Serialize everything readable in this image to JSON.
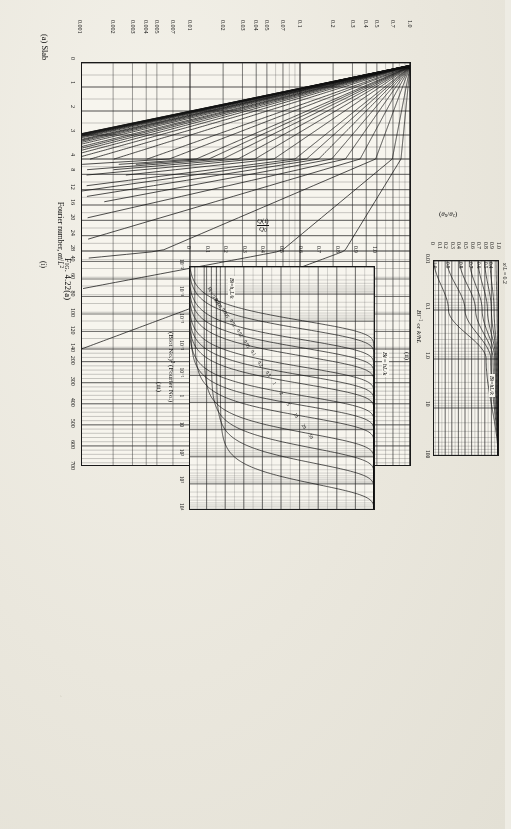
{
  "figure": {
    "caption_prefix": "Fig.",
    "caption_number": "4.22(a)",
    "part_label": "(a) Slab"
  },
  "panels": {
    "i": {
      "id": "(i)",
      "xlabel": "Fourier number, αt/L²",
      "ylabel": "(θ_c − θ_∞)/(θ_{i,o} − θ_∞)",
      "ylabel_parts": {
        "num_a": "θ",
        "num_a_sub": "c",
        "num_b": "θ",
        "num_b_sub": "∞",
        "den_a": "θ",
        "den_a_sub": "i,o",
        "den_b": "θ",
        "den_b_sub": "∞"
      },
      "legend": "Bi = hL/k",
      "xticks": [
        "0",
        "1",
        "2",
        "3",
        "4",
        "8",
        "12",
        "16",
        "20",
        "24",
        "28",
        "40",
        "60",
        "80",
        "100",
        "120",
        "140",
        "200",
        "300",
        "400",
        "500",
        "600",
        "700"
      ],
      "yticks": [
        "1.0",
        "0.7",
        "0.5",
        "0.4",
        "0.3",
        "0.2",
        "0.1",
        "0.07",
        "0.05",
        "0.04",
        "0.03",
        "0.02",
        "0.01",
        "0.007",
        "0.005",
        "0.004",
        "0.003",
        "0.002",
        "0.001"
      ],
      "curve_labels": [
        "0",
        "0.05",
        "0.1",
        "0.2",
        "0.3",
        "0.4",
        "0.5",
        "0.6",
        "0.7",
        "0.8",
        "1.0",
        "1.2",
        "1.4",
        "1.6",
        "1.8",
        "2",
        "2.5",
        "3",
        "4",
        "5",
        "6",
        "7",
        "8",
        "9",
        "10",
        "12",
        "14",
        "16",
        "18",
        "20",
        "25",
        "30",
        "35",
        "40",
        "45",
        "50",
        "60",
        "70",
        "80",
        "90",
        "100"
      ]
    },
    "ii": {
      "id": "(ii)",
      "xlabel": "Bi⁻¹ or k/hL",
      "ylabel": "(θ_x/θ_c)",
      "legend": "Bi = hL/k",
      "xticks": [
        "0.01",
        "0.1",
        "1.0",
        "10",
        "100"
      ],
      "yticks": [
        "0",
        "0.1",
        "0.2",
        "0.3",
        "0.4",
        "0.5",
        "0.6",
        "0.7",
        "0.8",
        "0.9",
        "1.0"
      ],
      "curve_label_lead": "x/L = 0.2",
      "curve_labels": [
        "0.2",
        "0.4",
        "0.5",
        "0.6",
        "0.7",
        "0.8",
        "0.9",
        "1.0"
      ]
    },
    "iii": {
      "id": "(iii)",
      "xlabel": "(Biot No.)² (Fourier No.)",
      "ylabel": "Q(t)/Q₀",
      "legend": "Bi = h_c L/k",
      "xticks": [
        "10⁻⁵",
        "10⁻⁴",
        "10⁻³",
        "10⁻²",
        "10⁻¹",
        "1",
        "10",
        "10²",
        "10³",
        "10⁴"
      ],
      "yticks": [
        "0",
        "0.1",
        "0.2",
        "0.3",
        "0.4",
        "0.5",
        "0.6",
        "0.7",
        "0.8",
        "0.9",
        "1.0"
      ],
      "curve_labels": [
        "Bi = 0.001",
        "0.002",
        "0.005",
        "0.01",
        "0.02",
        "0.05",
        "0.1",
        "0.2",
        "0.5",
        "1",
        "2",
        "5",
        "10",
        "20",
        "50"
      ]
    }
  },
  "chart_data": [
    {
      "type": "line",
      "title": "(i) Midplane temperature, slab",
      "xlabel": "Fourier number, αt/L²",
      "ylabel": "(θc−θ∞)/(θi,o−θ∞)",
      "xscale": "piecewise-linear",
      "yscale": "log",
      "xlim": [
        0,
        700
      ],
      "ylim": [
        0.001,
        1.0
      ],
      "grid": true,
      "legend": "Bi = hL/k",
      "legend_position": "upper-right-inside",
      "xticks": [
        0,
        1,
        2,
        3,
        4,
        8,
        12,
        16,
        20,
        24,
        28,
        40,
        60,
        80,
        100,
        120,
        140,
        200,
        300,
        400,
        500,
        600,
        700
      ],
      "yticks": [
        1.0,
        0.7,
        0.5,
        0.4,
        0.3,
        0.2,
        0.1,
        0.07,
        0.05,
        0.04,
        0.03,
        0.02,
        0.01,
        0.007,
        0.005,
        0.004,
        0.003,
        0.002,
        0.001
      ],
      "series": [
        {
          "name": "0",
          "note": "Bi=0, horizontal at 1.0"
        },
        {
          "name": "0.05"
        },
        {
          "name": "0.1"
        },
        {
          "name": "0.2"
        },
        {
          "name": "0.3"
        },
        {
          "name": "0.4"
        },
        {
          "name": "0.5"
        },
        {
          "name": "0.6"
        },
        {
          "name": "0.7"
        },
        {
          "name": "0.8"
        },
        {
          "name": "1.0"
        },
        {
          "name": "1.2"
        },
        {
          "name": "1.4"
        },
        {
          "name": "1.6"
        },
        {
          "name": "1.8"
        },
        {
          "name": "2"
        },
        {
          "name": "2.5"
        },
        {
          "name": "3"
        },
        {
          "name": "4"
        },
        {
          "name": "5"
        },
        {
          "name": "6"
        },
        {
          "name": "7"
        },
        {
          "name": "8"
        },
        {
          "name": "9"
        },
        {
          "name": "10"
        },
        {
          "name": "12"
        },
        {
          "name": "14"
        },
        {
          "name": "16"
        },
        {
          "name": "18"
        },
        {
          "name": "20"
        },
        {
          "name": "25"
        },
        {
          "name": "30"
        },
        {
          "name": "35"
        },
        {
          "name": "40"
        },
        {
          "name": "45"
        },
        {
          "name": "50"
        },
        {
          "name": "60"
        },
        {
          "name": "70"
        },
        {
          "name": "80"
        },
        {
          "name": "90"
        },
        {
          "name": "100"
        }
      ]
    },
    {
      "type": "line",
      "title": "(ii) Position-correction chart, slab",
      "xlabel": "Bi⁻¹ or k/hL",
      "ylabel": "(θx/θc)",
      "xscale": "log",
      "yscale": "linear",
      "xlim": [
        0.01,
        100
      ],
      "ylim": [
        0,
        1.0
      ],
      "grid": true,
      "legend": "Bi = hL/k",
      "xticks": [
        0.01,
        0.1,
        1.0,
        10,
        100
      ],
      "yticks": [
        0,
        0.1,
        0.2,
        0.3,
        0.4,
        0.5,
        0.6,
        0.7,
        0.8,
        0.9,
        1.0
      ],
      "series": [
        {
          "name": "x/L = 0.2",
          "values_at_x": [
            {
              "x": 0.01,
              "y": 0.97
            },
            {
              "x": 0.1,
              "y": 0.985
            },
            {
              "x": 1,
              "y": 0.995
            },
            {
              "x": 100,
              "y": 1.0
            }
          ]
        },
        {
          "name": "0.4",
          "values_at_x": [
            {
              "x": 0.01,
              "y": 0.88
            },
            {
              "x": 0.1,
              "y": 0.94
            },
            {
              "x": 1,
              "y": 0.985
            },
            {
              "x": 100,
              "y": 1.0
            }
          ]
        },
        {
          "name": "0.5",
          "values_at_x": [
            {
              "x": 0.01,
              "y": 0.8
            },
            {
              "x": 0.1,
              "y": 0.9
            },
            {
              "x": 1,
              "y": 0.975
            },
            {
              "x": 100,
              "y": 1.0
            }
          ]
        },
        {
          "name": "0.6",
          "values_at_x": [
            {
              "x": 0.01,
              "y": 0.7
            },
            {
              "x": 0.1,
              "y": 0.84
            },
            {
              "x": 1,
              "y": 0.965
            },
            {
              "x": 100,
              "y": 1.0
            }
          ]
        },
        {
          "name": "0.7",
          "values_at_x": [
            {
              "x": 0.01,
              "y": 0.57
            },
            {
              "x": 0.1,
              "y": 0.76
            },
            {
              "x": 1,
              "y": 0.95
            },
            {
              "x": 100,
              "y": 1.0
            }
          ]
        },
        {
          "name": "0.8",
          "values_at_x": [
            {
              "x": 0.01,
              "y": 0.42
            },
            {
              "x": 0.1,
              "y": 0.66
            },
            {
              "x": 1,
              "y": 0.925
            },
            {
              "x": 100,
              "y": 1.0
            }
          ]
        },
        {
          "name": "0.9",
          "values_at_x": [
            {
              "x": 0.01,
              "y": 0.23
            },
            {
              "x": 0.1,
              "y": 0.5
            },
            {
              "x": 1,
              "y": 0.89
            },
            {
              "x": 100,
              "y": 1.0
            }
          ]
        },
        {
          "name": "1.0",
          "values_at_x": [
            {
              "x": 0.01,
              "y": 0.03
            },
            {
              "x": 0.1,
              "y": 0.25
            },
            {
              "x": 1,
              "y": 0.82
            },
            {
              "x": 100,
              "y": 1.0
            }
          ]
        }
      ]
    },
    {
      "type": "line",
      "title": "(iii) Heat-loss chart, slab",
      "xlabel": "(Biot No.)² (Fourier No.)",
      "ylabel": "Q(t)/Q₀",
      "xscale": "log",
      "yscale": "linear",
      "xlim": [
        1e-05,
        10000.0
      ],
      "ylim": [
        0,
        1.0
      ],
      "grid": true,
      "legend": "Bi = h_cL/k",
      "xticks": [
        "1e-5",
        "1e-4",
        "1e-3",
        "1e-2",
        "1e-1",
        "1",
        "10",
        "1e2",
        "1e3",
        "1e4"
      ],
      "yticks": [
        0,
        0.1,
        0.2,
        0.3,
        0.4,
        0.5,
        0.6,
        0.7,
        0.8,
        0.9,
        1.0
      ],
      "series": [
        {
          "name": "0.001"
        },
        {
          "name": "0.002"
        },
        {
          "name": "0.005"
        },
        {
          "name": "0.01"
        },
        {
          "name": "0.02"
        },
        {
          "name": "0.05"
        },
        {
          "name": "0.1"
        },
        {
          "name": "0.2"
        },
        {
          "name": "0.5"
        },
        {
          "name": "1"
        },
        {
          "name": "2"
        },
        {
          "name": "5"
        },
        {
          "name": "10"
        },
        {
          "name": "20"
        },
        {
          "name": "50"
        }
      ]
    }
  ]
}
